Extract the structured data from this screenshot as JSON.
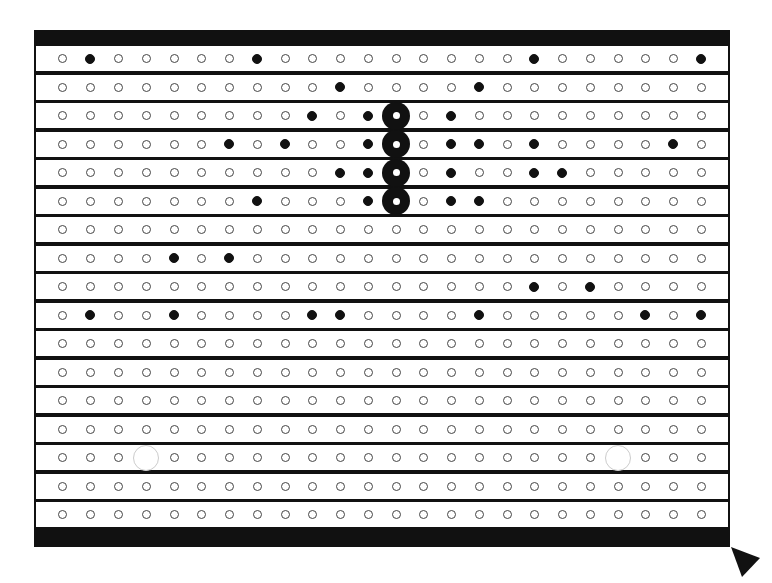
{
  "board": {
    "columns": 24,
    "rows": 17,
    "column_x": [
      62,
      90,
      118,
      146,
      174,
      201,
      229,
      257,
      285,
      312,
      340,
      368,
      396,
      423,
      451,
      479,
      507,
      534,
      562,
      590,
      618,
      645,
      673,
      701
    ],
    "colors": {
      "frame": "#111111",
      "band": "#ffffff",
      "hole_ring": "#444444",
      "peg": "#111111",
      "ghost": "#cccccc"
    },
    "row_pegs": [
      {
        "row": 1,
        "filled": [
          2,
          8,
          18,
          24
        ],
        "big": [],
        "ghost": []
      },
      {
        "row": 2,
        "filled": [
          11,
          16
        ],
        "big": [],
        "ghost": []
      },
      {
        "row": 3,
        "filled": [
          10,
          12,
          15
        ],
        "big": [
          13
        ],
        "ghost": []
      },
      {
        "row": 4,
        "filled": [
          7,
          9,
          12,
          15,
          16,
          18,
          23
        ],
        "big": [
          13
        ],
        "ghost": []
      },
      {
        "row": 5,
        "filled": [
          11,
          12,
          15,
          18,
          19
        ],
        "big": [
          13
        ],
        "ghost": []
      },
      {
        "row": 6,
        "filled": [
          8,
          12,
          15,
          16
        ],
        "big": [
          13
        ],
        "ghost": []
      },
      {
        "row": 7,
        "filled": [],
        "big": [],
        "ghost": []
      },
      {
        "row": 8,
        "filled": [
          5,
          7
        ],
        "big": [],
        "ghost": []
      },
      {
        "row": 9,
        "filled": [
          18,
          20
        ],
        "big": [],
        "ghost": []
      },
      {
        "row": 10,
        "filled": [
          2,
          5,
          10,
          11,
          16,
          22,
          24
        ],
        "big": [],
        "ghost": []
      },
      {
        "row": 11,
        "filled": [],
        "big": [],
        "ghost": []
      },
      {
        "row": 12,
        "filled": [],
        "big": [],
        "ghost": []
      },
      {
        "row": 13,
        "filled": [],
        "big": [],
        "ghost": []
      },
      {
        "row": 14,
        "filled": [],
        "big": [],
        "ghost": []
      },
      {
        "row": 15,
        "filled": [],
        "big": [],
        "ghost": [
          4,
          21
        ]
      },
      {
        "row": 16,
        "filled": [],
        "big": [],
        "ghost": []
      },
      {
        "row": 17,
        "filled": [],
        "big": [],
        "ghost": []
      }
    ]
  },
  "cursor": {
    "icon": "triangle-pointer-icon"
  }
}
